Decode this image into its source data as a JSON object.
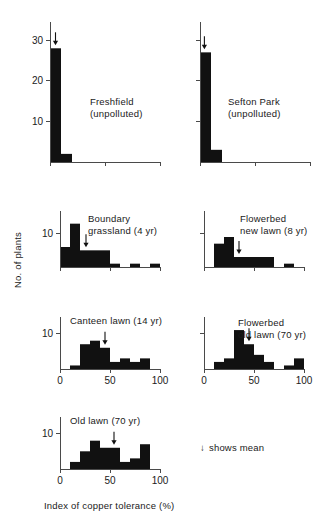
{
  "figure": {
    "x_axis_title": "Index of copper tolerance (%)",
    "y_axis_title": "No. of plants",
    "legend_note": "shows mean",
    "legend_arrow_glyph": "↓"
  },
  "chart_data": {
    "type": "bar",
    "title": "",
    "xlabel": "Index of copper tolerance (%)",
    "ylabel": "No. of plants",
    "xlim": [
      0,
      100
    ],
    "grid": false,
    "legend": "↓ shows mean",
    "bin_width": 10,
    "panels": [
      {
        "id": "freshfield",
        "caption": "Freshfield\n(unpolluted)",
        "caption_line1": "Freshfield",
        "caption_line2": "(unpolluted)",
        "ylim": [
          0,
          33
        ],
        "yticks": [
          10,
          20,
          30
        ],
        "ytick_labels": [
          "10",
          "20",
          "30"
        ],
        "xticks": [
          0,
          50,
          100
        ],
        "xtick_labels": [
          "",
          "",
          ""
        ],
        "bin_starts": [
          0,
          10,
          20,
          30,
          40,
          50,
          60,
          70,
          80,
          90
        ],
        "values": [
          28,
          2,
          0,
          0,
          0,
          0,
          0,
          0,
          0,
          0
        ],
        "mean": 5
      },
      {
        "id": "sefton-park",
        "caption": "Sefton Park\n(unpolluted)",
        "caption_line1": "Sefton Park",
        "caption_line2": "(unpolluted)",
        "ylim": [
          0,
          33
        ],
        "yticks": [
          10,
          20,
          30
        ],
        "ytick_labels": [
          "",
          "",
          ""
        ],
        "xticks": [
          0,
          50,
          100
        ],
        "xtick_labels": [
          "",
          "",
          ""
        ],
        "bin_starts": [
          0,
          10,
          20,
          30,
          40,
          50,
          60,
          70,
          80,
          90
        ],
        "values": [
          27,
          3,
          0,
          0,
          0,
          0,
          0,
          0,
          0,
          0
        ],
        "mean": 4
      },
      {
        "id": "boundary-grassland",
        "caption": "Boundary\ngrassland (4 yr)",
        "caption_line1": "Boundary",
        "caption_line2": "grassland (4 yr)",
        "ylim": [
          0,
          15
        ],
        "yticks": [
          10
        ],
        "ytick_labels": [
          "10"
        ],
        "xticks": [
          0,
          50,
          100
        ],
        "xtick_labels": [
          "",
          "",
          ""
        ],
        "bin_starts": [
          0,
          10,
          20,
          30,
          40,
          50,
          60,
          70,
          80,
          90
        ],
        "values": [
          6,
          13,
          5,
          5,
          5,
          1,
          0,
          1,
          0,
          1
        ],
        "mean": 26
      },
      {
        "id": "flowerbed-new-lawn",
        "caption": "Flowerbed\nnew lawn (8 yr)",
        "caption_line1": "Flowerbed",
        "caption_line2": "new lawn (8 yr)",
        "ylim": [
          0,
          15
        ],
        "yticks": [
          10
        ],
        "ytick_labels": [
          ""
        ],
        "xticks": [
          0,
          50,
          100
        ],
        "xtick_labels": [
          "",
          "",
          ""
        ],
        "bin_starts": [
          0,
          10,
          20,
          30,
          40,
          50,
          60,
          70,
          80,
          90
        ],
        "values": [
          0,
          7,
          9,
          3,
          3,
          3,
          3,
          0,
          1,
          0
        ],
        "mean": 35
      },
      {
        "id": "canteen-lawn",
        "caption": "Canteen lawn (14 yr)",
        "caption_line1": "Canteen lawn (14 yr)",
        "caption_line2": "",
        "ylim": [
          0,
          13
        ],
        "yticks": [
          10
        ],
        "ytick_labels": [
          "10"
        ],
        "xticks": [
          0,
          50,
          100
        ],
        "xtick_labels": [
          "0",
          "50",
          "100"
        ],
        "bin_starts": [
          0,
          10,
          20,
          30,
          40,
          50,
          60,
          70,
          80,
          90
        ],
        "values": [
          0,
          1,
          7,
          8,
          6,
          2,
          3,
          2,
          3,
          0
        ],
        "mean": 45
      },
      {
        "id": "flowerbed-old-lawn",
        "caption": "Flowerbed\nold lawn (70 yr)",
        "caption_line1": "Flowerbed",
        "caption_line2": "old lawn (70 yr)",
        "ylim": [
          0,
          13
        ],
        "yticks": [
          10
        ],
        "ytick_labels": [
          ""
        ],
        "xticks": [
          0,
          50,
          100
        ],
        "xtick_labels": [
          "0",
          "50",
          "100"
        ],
        "bin_starts": [
          0,
          10,
          20,
          30,
          40,
          50,
          60,
          70,
          80,
          90
        ],
        "values": [
          0,
          2,
          3,
          11,
          7,
          4,
          2,
          0,
          1,
          3
        ],
        "mean": 45
      },
      {
        "id": "old-lawn",
        "caption": "Old lawn (70 yr)",
        "caption_line1": "Old lawn (70 yr)",
        "caption_line2": "",
        "ylim": [
          0,
          13
        ],
        "yticks": [
          10
        ],
        "ytick_labels": [
          "10"
        ],
        "xticks": [
          0,
          50,
          100
        ],
        "xtick_labels": [
          "0",
          "50",
          "100"
        ],
        "bin_starts": [
          0,
          10,
          20,
          30,
          40,
          50,
          60,
          70,
          80,
          90
        ],
        "values": [
          0,
          2,
          5,
          8,
          6,
          6,
          2,
          3,
          7,
          0
        ],
        "mean": 54
      }
    ]
  }
}
